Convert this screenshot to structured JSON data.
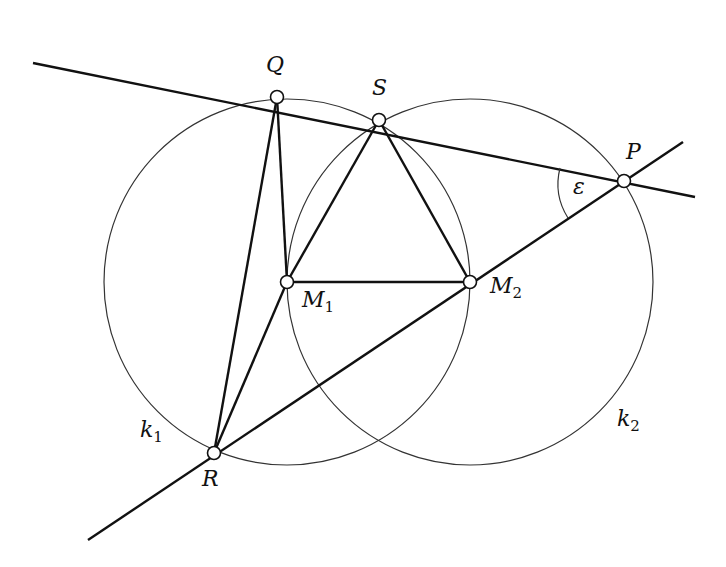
{
  "diagram": {
    "type": "geometry",
    "circles": [
      {
        "name": "k1",
        "center": "M1",
        "cx": 287,
        "cy": 282,
        "r": 183
      },
      {
        "name": "k2",
        "center": "M2",
        "cx": 470,
        "cy": 282,
        "r": 183
      }
    ],
    "points": [
      {
        "name": "Q",
        "x": 277,
        "y": 97
      },
      {
        "name": "S",
        "x": 379,
        "y": 120
      },
      {
        "name": "P",
        "x": 624,
        "y": 181
      },
      {
        "name": "R",
        "x": 214,
        "y": 453
      },
      {
        "name": "M1",
        "x": 287,
        "y": 282
      },
      {
        "name": "M2",
        "x": 470,
        "y": 282
      }
    ],
    "lines": [
      {
        "name": "line-QSP",
        "x1": 33,
        "y1": 63,
        "x2": 695,
        "y2": 197
      },
      {
        "name": "line-RP",
        "x1": 88,
        "y1": 540,
        "x2": 683,
        "y2": 142
      }
    ],
    "segments": [
      "Q-R",
      "Q-M1",
      "R-M1",
      "M1-S",
      "S-M2",
      "M1-M2"
    ],
    "angle": {
      "label": "ε",
      "vertex": "P"
    }
  },
  "labels": {
    "Q": "Q",
    "S": "S",
    "P": "P",
    "R": "R",
    "M": "M",
    "sub1": "1",
    "sub2": "2",
    "k": "k",
    "epsilon": "ε"
  },
  "colors": {
    "stroke": "#111111",
    "thin": "#333333",
    "background": "#ffffff"
  }
}
